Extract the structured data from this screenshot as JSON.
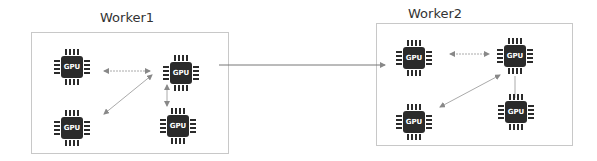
{
  "workers": [
    {
      "title": "Worker1",
      "box": {
        "x": 31,
        "y": 32,
        "w": 198,
        "h": 122
      },
      "title_pos": {
        "x": 100,
        "y": 10
      },
      "gpus": [
        {
          "label": "GPU",
          "cx": 72,
          "cy": 67
        },
        {
          "label": "GPU",
          "cx": 181,
          "cy": 73
        },
        {
          "label": "GPU",
          "cx": 72,
          "cy": 128
        },
        {
          "label": "GPU",
          "cx": 178,
          "cy": 126
        }
      ]
    },
    {
      "title": "Worker2",
      "box": {
        "x": 376,
        "y": 23,
        "w": 197,
        "h": 123
      },
      "title_pos": {
        "x": 408,
        "y": 6
      },
      "gpus": [
        {
          "label": "GPU",
          "cx": 414,
          "cy": 58
        },
        {
          "label": "GPU",
          "cx": 515,
          "cy": 56
        },
        {
          "label": "GPU",
          "cx": 414,
          "cy": 122
        },
        {
          "label": "GPU",
          "cx": 516,
          "cy": 112
        }
      ]
    }
  ],
  "connections": [
    {
      "x1": 104,
      "y1": 71,
      "x2": 150,
      "y2": 71,
      "style": "dotted",
      "arrows": "both"
    },
    {
      "x1": 104,
      "y1": 114,
      "x2": 152,
      "y2": 75,
      "style": "solid",
      "arrows": "both"
    },
    {
      "x1": 167,
      "y1": 85,
      "x2": 167,
      "y2": 106,
      "style": "solid",
      "arrows": "both"
    },
    {
      "x1": 219,
      "y1": 65,
      "x2": 385,
      "y2": 65,
      "style": "solid",
      "arrows": "end"
    },
    {
      "x1": 450,
      "y1": 54,
      "x2": 489,
      "y2": 54,
      "style": "dotted",
      "arrows": "both"
    },
    {
      "x1": 440,
      "y1": 107,
      "x2": 500,
      "y2": 75,
      "style": "solid",
      "arrows": "both"
    },
    {
      "x1": 515,
      "y1": 76,
      "x2": 515,
      "y2": 98,
      "style": "solid",
      "arrows": "none"
    }
  ]
}
